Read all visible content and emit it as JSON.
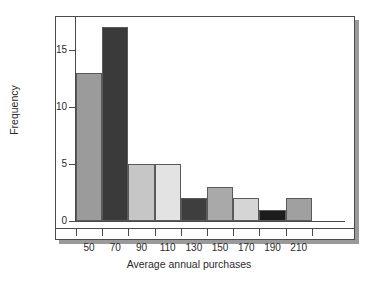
{
  "chart_data": {
    "type": "bar",
    "title": "",
    "xlabel": "Average annual purchases",
    "ylabel": "Frequency",
    "categories": [
      "50",
      "70",
      "90",
      "110",
      "130",
      "150",
      "170",
      "190",
      "210"
    ],
    "values": [
      13,
      17,
      5,
      5,
      2,
      3,
      2,
      1,
      2
    ],
    "bin_edges": [
      40,
      60,
      80,
      100,
      120,
      140,
      160,
      180,
      200,
      220
    ],
    "bin_width": 20,
    "x_tick_labels": [
      "50",
      "70",
      "90",
      "110",
      "130",
      "150",
      "170",
      "190",
      "210"
    ],
    "y_tick_labels": [
      "0",
      "5",
      "10",
      "15"
    ],
    "y_tick_values": [
      0,
      5,
      10,
      15
    ],
    "ylim": [
      0,
      18
    ],
    "xlim": [
      40,
      228
    ],
    "grid": false,
    "legend": null,
    "bar_colors": [
      "#9b9b9b",
      "#3a3a3a",
      "#c6c6c6",
      "#e3e3e3",
      "#3e3e3e",
      "#a9a9a9",
      "#d5d5d5",
      "#1c1c1c",
      "#a0a0a0"
    ],
    "bar_edge_color": "#5a5a5a",
    "axis_color": "#4a4a4a",
    "background_color": "#ffffff",
    "shadow_color": "#9a9a9a"
  }
}
